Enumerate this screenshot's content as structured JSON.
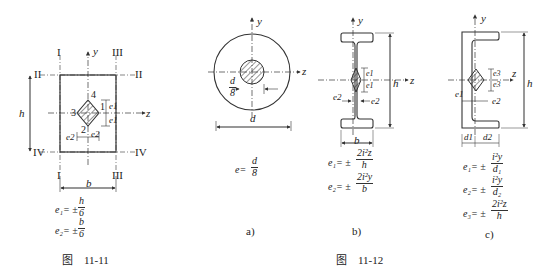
{
  "fig_11_11": {
    "caption": "图　11-11",
    "axis_y": "y",
    "axis_z": "z",
    "roman": {
      "I_top": "I",
      "III_top": "III",
      "II_left": "II",
      "II_right": "II",
      "IV_left": "IV",
      "IV_right": "IV",
      "I_bottom": "I",
      "III_bottom": "III"
    },
    "dims": {
      "h": "h",
      "b": "b"
    },
    "points": {
      "p1": "1",
      "p2": "2",
      "p3": "3",
      "p4": "4"
    },
    "e_labels": {
      "e1a": "e1",
      "e1b": "e1",
      "e2a": "e2",
      "e2b": "e2"
    },
    "formulas": [
      {
        "lhs": "e₁= ±",
        "num": "h",
        "den": "6"
      },
      {
        "lhs": "e₂= ±",
        "num": "b",
        "den": "6"
      }
    ]
  },
  "fig_11_12": {
    "caption": "图　11-12",
    "a": {
      "label": "a)",
      "axis_y": "y",
      "axis_z": "z",
      "dim_d": "d",
      "core_num": "d",
      "core_den": "8",
      "formula": {
        "lhs": "e=",
        "num": "d",
        "den": "8"
      }
    },
    "b": {
      "label": "b)",
      "axis_y": "y",
      "axis_z": "z",
      "dim_h": "h",
      "dim_b": "b",
      "e_labels": {
        "e1a": "e1",
        "e1b": "e1",
        "e2a": "e2",
        "e2b": "e2"
      },
      "formulas": [
        {
          "lhs": "e₁= ±",
          "num": "2i²z",
          "den": "h"
        },
        {
          "lhs": "e₂= ±",
          "num": "2i²y",
          "den": "b"
        }
      ]
    },
    "c": {
      "label": "c)",
      "axis_y": "y",
      "axis_z": "z",
      "dim_h": "h",
      "dim_d1": "d1",
      "dim_d2": "d2",
      "e_labels": {
        "e1": "e1",
        "e2": "e2",
        "e3a": "e3",
        "e3b": "e3"
      },
      "formulas": [
        {
          "lhs": "e₁= ±",
          "num": "i²y",
          "den": "d₁"
        },
        {
          "lhs": "e₂= ±",
          "num": "i²y",
          "den": "d₂"
        },
        {
          "lhs": "e₃= ±",
          "num": "2i²z",
          "den": "h"
        }
      ]
    }
  }
}
